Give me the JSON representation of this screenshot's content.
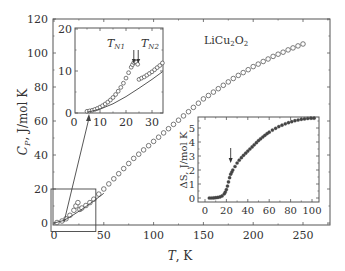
{
  "chart_data": [
    {
      "id": "main",
      "type": "scatter",
      "title": "",
      "annotation": "LiCu₂O₂",
      "xlabel": "T, K",
      "ylabel": "C_P, J/mol K",
      "xlim": [
        0,
        275
      ],
      "ylim": [
        0,
        120
      ],
      "xticks": [
        0,
        50,
        100,
        150,
        200,
        250
      ],
      "yticks": [
        0,
        20,
        40,
        60,
        80,
        100,
        120
      ],
      "grid": false,
      "series": [
        {
          "name": "C_P (open circles)",
          "marker": "open-circle",
          "x": [
            3,
            8,
            12,
            16,
            20,
            22,
            24,
            26,
            28,
            32,
            36,
            40,
            45,
            50,
            55,
            60,
            65,
            70,
            75,
            80,
            85,
            90,
            95,
            100,
            105,
            110,
            115,
            120,
            125,
            130,
            135,
            140,
            145,
            150,
            155,
            160,
            165,
            170,
            175,
            180,
            185,
            190,
            195,
            200,
            205,
            210,
            215,
            220,
            225,
            230,
            235,
            240,
            245,
            250
          ],
          "y": [
            0.3,
            1.2,
            2.5,
            4.5,
            7.5,
            10,
            12,
            8,
            8.8,
            10.3,
            12,
            14,
            17,
            20,
            23,
            26,
            29,
            32,
            35,
            38,
            40.5,
            43,
            45.5,
            48,
            50.5,
            53,
            55.5,
            58,
            60.5,
            63,
            65.5,
            68,
            70.5,
            73,
            75,
            77,
            79,
            81,
            83,
            85,
            86.8,
            88.5,
            90.2,
            92,
            93.5,
            95,
            96.5,
            98,
            99.3,
            100.5,
            101.8,
            103,
            104.2,
            105.3
          ]
        },
        {
          "name": "lattice (solid line)",
          "marker": "line",
          "x": [
            0,
            10,
            20,
            30,
            40,
            50
          ],
          "y": [
            0,
            1.5,
            5,
            8.8,
            13,
            17.5
          ]
        }
      ],
      "zoom_box": {
        "x": [
          -3,
          42
        ],
        "y": [
          -5,
          20
        ]
      }
    },
    {
      "id": "inset-cp",
      "type": "scatter",
      "xlabel": "",
      "ylabel": "",
      "xlim": [
        1,
        34
      ],
      "ylim": [
        0,
        20
      ],
      "xticks": [
        0,
        10,
        20,
        30
      ],
      "yticks": [
        0,
        10,
        20
      ],
      "annotations": [
        "T_N1",
        "T_N2"
      ],
      "arrows_at_T": [
        23,
        24.7
      ],
      "series": [
        {
          "name": "C_P (open circles)",
          "marker": "open-circle",
          "x": [
            5,
            6,
            7,
            8,
            9,
            10,
            11,
            12,
            13,
            14,
            15,
            16,
            17,
            18,
            19,
            20,
            21,
            22,
            22.5,
            23,
            23.5,
            24,
            24.5,
            25,
            26,
            27,
            28,
            29,
            30,
            31,
            32,
            33,
            34
          ],
          "y": [
            0.4,
            0.5,
            0.65,
            0.85,
            1.1,
            1.4,
            1.75,
            2.15,
            2.6,
            3.1,
            3.7,
            4.4,
            5.2,
            6.1,
            7.1,
            8.3,
            9.6,
            10.9,
            11.5,
            12.0,
            12.2,
            12.1,
            11.6,
            8.0,
            8.3,
            8.6,
            9.0,
            9.4,
            9.8,
            10.3,
            10.8,
            11.3,
            11.9
          ]
        },
        {
          "name": "lattice (solid line)",
          "marker": "line",
          "x": [
            5,
            10,
            15,
            20,
            25,
            30,
            34
          ],
          "y": [
            0.2,
            0.9,
            2.2,
            3.9,
            5.9,
            8.0,
            9.8
          ]
        }
      ]
    },
    {
      "id": "inset-entropy",
      "type": "scatter",
      "xlabel": "",
      "ylabel": "ΔS, J/mol K",
      "xlim": [
        -5,
        105
      ],
      "ylim": [
        -0.3,
        5.9
      ],
      "xticks": [
        0,
        20,
        40,
        60,
        80,
        100
      ],
      "yticks": [
        0,
        1,
        2,
        3,
        4,
        5
      ],
      "arrow_at_T": 24,
      "series": [
        {
          "name": "ΔS (filled)",
          "marker": "filled-circle",
          "x": [
            4,
            6,
            8,
            10,
            12,
            14,
            16,
            18,
            19,
            20,
            21,
            22,
            23,
            24,
            25,
            26,
            28,
            30,
            32,
            34,
            36,
            38,
            40,
            42,
            44,
            46,
            48,
            50,
            52,
            54,
            56,
            58,
            60,
            63,
            66,
            69,
            72,
            75,
            78,
            81,
            84,
            87,
            90,
            93,
            96,
            99,
            102
          ],
          "y": [
            0,
            0,
            0.01,
            0.02,
            0.04,
            0.08,
            0.15,
            0.3,
            0.42,
            0.6,
            0.85,
            1.15,
            1.45,
            1.7,
            1.85,
            2.0,
            2.25,
            2.5,
            2.7,
            2.88,
            3.05,
            3.2,
            3.35,
            3.5,
            3.65,
            3.8,
            3.95,
            4.1,
            4.23,
            4.36,
            4.48,
            4.6,
            4.7,
            4.85,
            4.98,
            5.1,
            5.2,
            5.3,
            5.38,
            5.45,
            5.52,
            5.57,
            5.62,
            5.65,
            5.68,
            5.7,
            5.7
          ]
        }
      ]
    }
  ],
  "labels": {
    "main_xlabel_T": "T",
    "main_xlabel_unit": ", K",
    "main_ylabel_C": "C",
    "main_ylabel_sub": "P",
    "main_ylabel_unit": ", J/mol K",
    "compound_main": "LiCu",
    "compound_sub1": "2",
    "compound_mid": "O",
    "compound_sub2": "2",
    "tn1_T": "T",
    "tn1_sub": "N1",
    "tn2_T": "T",
    "tn2_sub": "N2",
    "ds_ylabel": "ΔS, J/mol K"
  },
  "colors": {
    "axis": "#555555",
    "marker": "#444444",
    "text": "#333333"
  }
}
